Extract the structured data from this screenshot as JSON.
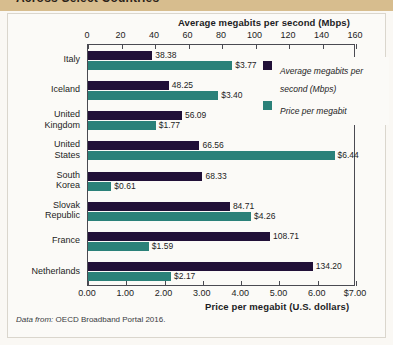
{
  "header": {
    "title": "Across Select Countries"
  },
  "chart_data": {
    "type": "bar",
    "orientation": "horizontal",
    "title": "Across Select Countries",
    "categories": [
      "Italy",
      "Iceland",
      "United Kingdom",
      "United States",
      "South Korea",
      "Slovak Republic",
      "France",
      "Netherlands"
    ],
    "series": [
      {
        "name": "Average megabits per second (Mbps)",
        "color": "#211038",
        "axis": "top",
        "values": [
          38.38,
          48.25,
          56.09,
          66.56,
          68.33,
          84.71,
          108.71,
          134.2
        ],
        "labels": [
          "38.38",
          "48.25",
          "56.09",
          "66.56",
          "68.33",
          "84.71",
          "108.71",
          "134.20"
        ]
      },
      {
        "name": "Price per megabit",
        "color": "#2b8179",
        "axis": "bottom",
        "values": [
          3.77,
          3.4,
          1.77,
          6.44,
          0.61,
          4.26,
          1.59,
          2.17
        ],
        "labels": [
          "$3.77",
          "$3.40",
          "$1.77",
          "$6.44",
          "$0.61",
          "$4.26",
          "$1.59",
          "$2.17"
        ]
      }
    ],
    "top_axis": {
      "label": "Average megabits per second (Mbps)",
      "ticks": [
        0,
        20,
        40,
        60,
        80,
        100,
        120,
        140,
        160
      ],
      "tick_labels": [
        "0",
        "20",
        "40",
        "60",
        "80",
        "100",
        "120",
        "140",
        "160"
      ],
      "range": [
        0,
        160
      ]
    },
    "bottom_axis": {
      "label": "Price per megabit (U.S. dollars)",
      "ticks": [
        0,
        1,
        2,
        3,
        4,
        5,
        6,
        7
      ],
      "tick_labels": [
        "0.00",
        "1.00",
        "2.00",
        "3.00",
        "4.00",
        "5.00",
        "6.00",
        "$7.00"
      ],
      "range": [
        0,
        7
      ]
    },
    "legend": {
      "position": "top-right",
      "entries": [
        {
          "label": "Average megabits per second (Mbps)",
          "color": "#211038"
        },
        {
          "label": "Price per megabit",
          "color": "#2b8179"
        }
      ]
    },
    "grid": false
  },
  "source": {
    "lead": "Data from:",
    "text": " OECD Broadband Portal 2016."
  },
  "colors": {
    "mbps": "#211038",
    "price": "#2b8179",
    "band": "#d7bd8e",
    "panel": "#fbfaf7"
  }
}
